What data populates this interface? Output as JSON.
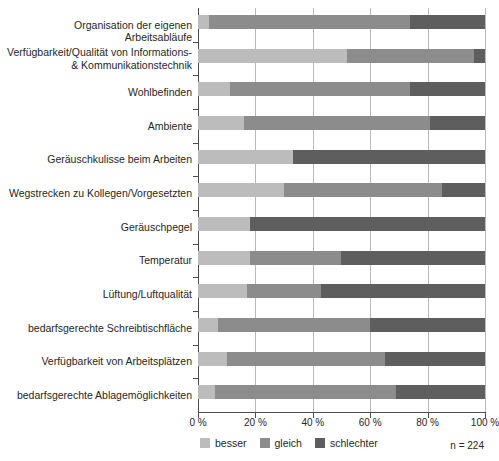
{
  "chart_data": {
    "type": "bar",
    "orientation": "horizontal",
    "stacked": true,
    "title": "",
    "subtitle": "",
    "xlabel": "",
    "ylabel": "",
    "xlim": [
      0,
      100
    ],
    "unit": "%",
    "grid": true,
    "legend_position": "bottom",
    "sample_size_label": "n = 224",
    "tick_labels": [
      "0 %",
      "20 %",
      "40 %",
      "60 %",
      "80 %",
      "100 %"
    ],
    "tick_values": [
      0,
      20,
      40,
      60,
      80,
      100
    ],
    "categories": [
      "Organisation der eigenen Arbeitsabläufe",
      "Verfügbarkeit/Qualität von Informations-\n& Kommunikationstechnik",
      "Wohlbefinden",
      "Ambiente",
      "Geräuschkulisse beim Arbeiten",
      "Wegstrecken zu Kollegen/Vorgesetzten",
      "Geräuschpegel",
      "Temperatur",
      "Lüftung/Luftqualität",
      "bedarfsgerechte Schreibtischfläche",
      "Verfügbarkeit von Arbeitsplätzen",
      "bedarfsgerechte Ablagemöglichkeiten"
    ],
    "series": [
      {
        "name": "besser",
        "color": "#bcbcbc",
        "values": [
          4,
          52,
          11,
          16,
          33,
          30,
          18,
          18,
          17,
          7,
          10,
          6
        ]
      },
      {
        "name": "gleich",
        "color": "#8c8c8c",
        "values": [
          70,
          44,
          63,
          65,
          0,
          55,
          0,
          32,
          26,
          53,
          55,
          63
        ]
      },
      {
        "name": "schlechter",
        "color": "#5e5e5e",
        "values": [
          26,
          4,
          26,
          19,
          67,
          15,
          82,
          50,
          57,
          40,
          35,
          31
        ]
      }
    ]
  },
  "legend": {
    "items": [
      {
        "label": "besser",
        "color": "#bcbcbc"
      },
      {
        "label": "gleich",
        "color": "#8c8c8c"
      },
      {
        "label": "schlechter",
        "color": "#5e5e5e"
      }
    ]
  },
  "footnote": {
    "n": "n = 224"
  }
}
